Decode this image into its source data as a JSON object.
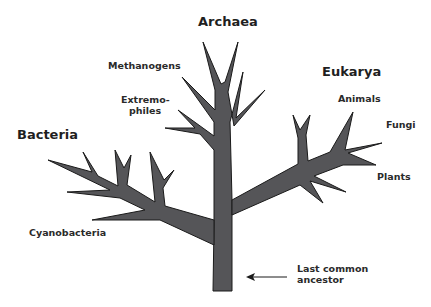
{
  "diagram": {
    "type": "phylogenetic-tree",
    "tree_fill": "#555558",
    "tree_stroke": "#1a1a1a",
    "domains": [
      {
        "name": "Archaea",
        "groups": [
          "Methanogens",
          "Extremophiles"
        ]
      },
      {
        "name": "Bacteria",
        "groups": [
          "Cyanobacteria"
        ]
      },
      {
        "name": "Eukarya",
        "groups": [
          "Animals",
          "Fungi",
          "Plants"
        ]
      }
    ],
    "labels": {
      "archaea": "Archaea",
      "bacteria": "Bacteria",
      "eukarya": "Eukarya",
      "methanogens": "Methanogens",
      "extremophiles_line1": "Extremo-",
      "extremophiles_line2": "philes",
      "cyanobacteria": "Cyanobacteria",
      "animals": "Animals",
      "fungi": "Fungi",
      "plants": "Plants",
      "lca_line1": "Last common",
      "lca_line2": "ancestor"
    },
    "root_arrow": {
      "direction": "left",
      "points_to": "trunk base"
    }
  }
}
